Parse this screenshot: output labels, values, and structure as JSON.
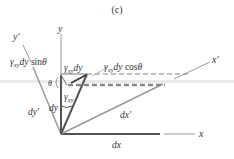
{
  "figure": {
    "panel_label": "(c)",
    "axes": {
      "x": "x",
      "y": "y",
      "x_prime": "x′",
      "y_prime": "y′"
    },
    "labels": {
      "gamma_dy_sin": "γxy dy sinθ",
      "gamma_dy_sin_parts": {
        "gamma": "γ",
        "sub": "xy",
        "dy": "dy",
        "fn": " sin",
        "theta": "θ"
      },
      "gamma_dy": "γxy dy",
      "gamma_dy_parts": {
        "gamma": "γ",
        "sub": "xy",
        "dy": "dy"
      },
      "gamma_dy_cos": "γxy dy cosθ",
      "gamma_dy_cos_parts": {
        "gamma": "γ",
        "sub": "xy",
        "dy": "dy",
        "fn": " cos",
        "theta": "θ"
      },
      "gamma_xy": {
        "gamma": "γ",
        "sub": "xy"
      },
      "theta": "θ",
      "dy": "dy",
      "dy_prime": "dy′",
      "dx": "dx",
      "dx_prime": "dx′"
    },
    "colors": {
      "axis": "#888888",
      "element": "#555555",
      "dashed": "#999999",
      "text": "#333333"
    }
  }
}
